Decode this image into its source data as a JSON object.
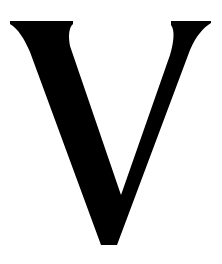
{
  "glyph": {
    "character": "V",
    "color": "#000000",
    "background": "#ffffff"
  }
}
